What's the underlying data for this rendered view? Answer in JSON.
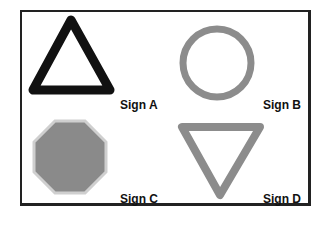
{
  "figure": {
    "signs": [
      {
        "id": "A",
        "label": "Sign A",
        "shape": "triangle-up",
        "stroke": "#111111",
        "fill": "none"
      },
      {
        "id": "B",
        "label": "Sign B",
        "shape": "circle",
        "stroke": "#8c8c8c",
        "fill": "none"
      },
      {
        "id": "C",
        "label": "Sign C",
        "shape": "octagon",
        "stroke": "#c8c8c8",
        "fill": "#8a8a8a"
      },
      {
        "id": "D",
        "label": "Sign D",
        "shape": "triangle-down",
        "stroke": "#8c8c8c",
        "fill": "none"
      }
    ]
  }
}
